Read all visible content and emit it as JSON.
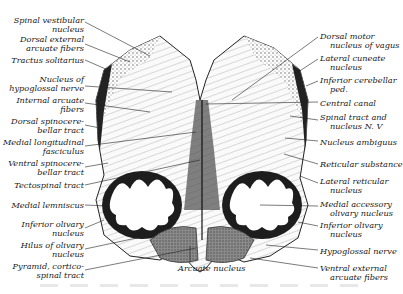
{
  "figure": {
    "signature": "Schädel"
  },
  "labels_left": [
    {
      "text": [
        "Spinal vestibular",
        "nucleus"
      ],
      "x": 84,
      "y": 16
    },
    {
      "text": [
        "Dorsal external",
        "arcuate fibers"
      ],
      "x": 84,
      "y": 35
    },
    {
      "text": [
        "Tractus solitarius"
      ],
      "x": 84,
      "y": 56
    },
    {
      "text": [
        "Nucleus of",
        "hypoglossal nerve"
      ],
      "x": 84,
      "y": 75
    },
    {
      "text": [
        "Internal arcuate",
        "fibers"
      ],
      "x": 84,
      "y": 96
    },
    {
      "text": [
        "Dorsal spinocere-",
        "bellar tract"
      ],
      "x": 84,
      "y": 117
    },
    {
      "text": [
        "Medial longitudinal",
        "fasciculus"
      ],
      "x": 84,
      "y": 138
    },
    {
      "text": [
        "Ventral spinocere-",
        "bellar tract"
      ],
      "x": 84,
      "y": 159
    },
    {
      "text": [
        "Tectospinal tract"
      ],
      "x": 84,
      "y": 181
    },
    {
      "text": [
        "Medial lemniscus"
      ],
      "x": 84,
      "y": 201
    },
    {
      "text": [
        "Inferior olivary",
        "nucleus"
      ],
      "x": 84,
      "y": 220
    },
    {
      "text": [
        "Hilus of olivary",
        "nucleus"
      ],
      "x": 84,
      "y": 241
    },
    {
      "text": [
        "Pyramid, cortico-",
        "spinal tract"
      ],
      "x": 84,
      "y": 262
    }
  ],
  "labels_right": [
    {
      "text": [
        "Dorsal motor",
        "nucleus of vagus"
      ],
      "x": 320,
      "y": 32
    },
    {
      "text": [
        "Lateral cuneate",
        "nucleus"
      ],
      "x": 320,
      "y": 54
    },
    {
      "text": [
        "Inferior cerebellar",
        "ped."
      ],
      "x": 320,
      "y": 76
    },
    {
      "text": [
        "Central canal"
      ],
      "x": 320,
      "y": 99
    },
    {
      "text": [
        "Spinal tract and",
        "nucleus N. V"
      ],
      "x": 320,
      "y": 113
    },
    {
      "text": [
        "Nucleus ambiguus"
      ],
      "x": 320,
      "y": 138
    },
    {
      "text": [
        "Reticular substance"
      ],
      "x": 320,
      "y": 160
    },
    {
      "text": [
        "Lateral reticular",
        "nucleus"
      ],
      "x": 320,
      "y": 177
    },
    {
      "text": [
        "Medial accessory",
        "olivary nucleus"
      ],
      "x": 320,
      "y": 200
    },
    {
      "text": [
        "Inferior olivary",
        "nucleus"
      ],
      "x": 320,
      "y": 221
    },
    {
      "text": [
        "Hypoglossal nerve"
      ],
      "x": 320,
      "y": 247
    },
    {
      "text": [
        "Ventral external",
        "arcuate fibers"
      ],
      "x": 320,
      "y": 264
    }
  ],
  "labels_bottom": [
    {
      "text": [
        "Arcuate nucleus"
      ],
      "x": 178,
      "y": 264
    }
  ],
  "colors": {
    "ink": "#1a1a1a",
    "background": "#ffffff",
    "pyramid_fill": "#7a7a7a",
    "olive_fill": "#2a2a2a"
  }
}
